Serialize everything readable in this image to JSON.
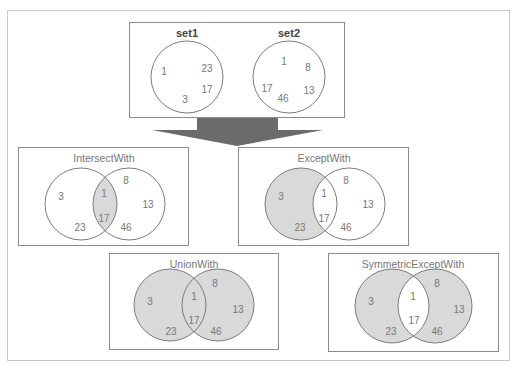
{
  "colors": {
    "outer_border": "#c8c8c8",
    "box_border": "#8c8c8c",
    "circle_stroke": "#6e6e6e",
    "fill_shaded": "#d9d9d9",
    "arrow": "#6b6b6b",
    "text": "#777777",
    "set_title": "#444444"
  },
  "source": {
    "set1": {
      "title": "set1",
      "elements": [
        "1",
        "23",
        "17",
        "3"
      ]
    },
    "set2": {
      "title": "set2",
      "elements": [
        "1",
        "8",
        "17",
        "13",
        "46"
      ]
    }
  },
  "operations": [
    {
      "title": "IntersectWith",
      "shaded": "intersection",
      "left_only": [
        "3",
        "23"
      ],
      "both": [
        "1",
        "17"
      ],
      "right_only": [
        "8",
        "13",
        "46"
      ]
    },
    {
      "title": "ExceptWith",
      "shaded": "left-only",
      "left_only": [
        "3",
        "23"
      ],
      "both": [
        "1",
        "17"
      ],
      "right_only": [
        "8",
        "13",
        "46"
      ]
    },
    {
      "title": "UnionWith",
      "shaded": "union",
      "left_only": [
        "3",
        "23"
      ],
      "both": [
        "1",
        "17"
      ],
      "right_only": [
        "8",
        "13",
        "46"
      ]
    },
    {
      "title": "SymmetricExceptWith",
      "shaded": "symmetric-difference",
      "left_only": [
        "3",
        "23"
      ],
      "both": [
        "1",
        "17"
      ],
      "right_only": [
        "8",
        "13",
        "46"
      ]
    }
  ]
}
